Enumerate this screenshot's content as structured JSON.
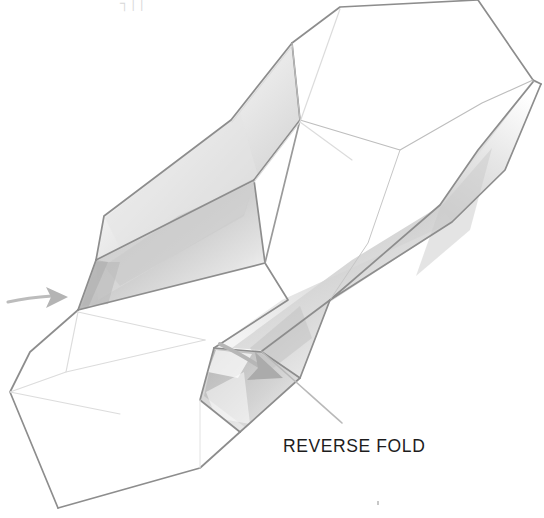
{
  "page": {
    "title": "Reverse Fold",
    "background_color": "#ffffff",
    "width": 544,
    "height": 518,
    "medium": "pencil line drawing"
  },
  "labels": {
    "caption": "REVERSE FOLD",
    "caption_color": "#1d1d1d",
    "top_clipped_fragment": "┐││"
  },
  "palette": {
    "outline": "#8d8d8d",
    "outline_strong": "#7a7a7a",
    "crease_faint": "#d8d8d8",
    "shade_light": "#ededed",
    "shade_mid": "#d6d6d6",
    "shade_dark": "#b9b9b9",
    "arrow_gray": "#b9b9b9",
    "paper_white": "#ffffff"
  },
  "illustration": {
    "subject": "origami model mid reverse-fold",
    "arrows": [
      {
        "name": "left-push-arrow",
        "direction": "right",
        "tail": [
          8,
          301
        ],
        "head": [
          62,
          297
        ],
        "color": "#b9b9b9"
      },
      {
        "name": "reverse-fold-arrow",
        "direction": "down-right",
        "tail": [
          214,
          347
        ],
        "head": [
          280,
          374
        ],
        "color": "#b0b0b0"
      }
    ],
    "leader_line": {
      "name": "caption-leader",
      "from": [
        262,
        352
      ],
      "to": [
        340,
        421
      ]
    },
    "facets": [
      {
        "id": "top-right-upper",
        "tone": "paper_white"
      },
      {
        "id": "top-right-inner-bevel",
        "tone": "shade_mid"
      },
      {
        "id": "upper-left-panel",
        "tone": "shade_light"
      },
      {
        "id": "central-rhombus",
        "tone": "shade_mid"
      },
      {
        "id": "right-diagonal-band",
        "tone": "shade_mid"
      },
      {
        "id": "lower-flap-triangle",
        "tone": "shade_dark"
      },
      {
        "id": "bottom-left-panel",
        "tone": "paper_white"
      }
    ]
  }
}
